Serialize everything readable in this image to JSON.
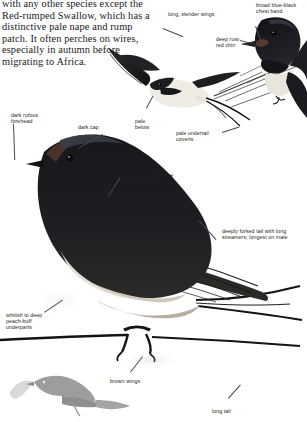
{
  "page": {
    "width": 307,
    "height": 422,
    "background": "#ffffff",
    "ink": "#231f20",
    "leader_color": "#4a4a4a"
  },
  "intro": {
    "text": "with any other species except the Red-rumped Swallow, which has a distinctive pale nape and rump patch. It often perches on wires, especially in autumn before migrating to Africa."
  },
  "labels": {
    "long_slender_wings": "long, slender wings",
    "broad_chest_band": "broad blue-black chest band",
    "deep_rust_red_chin": "deep rust-red chin",
    "dark_rufous_forehead": "dark rufous forehead",
    "dark_cap": "dark cap",
    "pale_below": "pale below",
    "pale_undertail_coverts": "pale undertail coverts",
    "glossy_blue_upperparts": "deep, glossy blue upperparts",
    "deeply_forked_tail": "deeply forked tail with long streamers; longest on male",
    "whitish_underparts": "whitish to deep peach-buff underparts",
    "brown_wings": "brown wings",
    "long_tail": "long tail"
  },
  "artwork": {
    "flying_bird": "swallow-in-flight-illustration",
    "perched_head": "swallow-head-and-chest-illustration",
    "main_bird": "perched-swallow-main-illustration",
    "silhouette": "swallow-silhouette-illustration",
    "colors": {
      "glossy_blue_black": "#15161a",
      "dark_ink": "#1b1b1f",
      "wing_brown": "#3c3a36",
      "buff": "#cfc7ba",
      "pale": "#efece6",
      "silhouette_gray": "#9b9b9b",
      "silhouette_light": "#d8d8d8",
      "rust": "#6b4a3a"
    }
  }
}
